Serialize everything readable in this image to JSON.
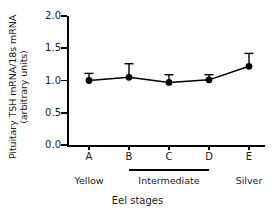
{
  "chart_data": {
    "type": "line",
    "title": "",
    "xlabel": "Eel stages",
    "ylabel": "Pituitary TSH mRNA/18s mRNA (arbitrary units)",
    "ylabel_lines": [
      "Pituitary TSH mRNA/18s mRNA",
      "(arbitrary units)"
    ],
    "categories": [
      "A",
      "B",
      "C",
      "D",
      "E"
    ],
    "values": [
      1.0,
      1.05,
      0.97,
      1.01,
      1.22
    ],
    "errors": [
      0.11,
      0.21,
      0.12,
      0.08,
      0.2
    ],
    "error_type": "SEM",
    "ylim": [
      0.0,
      2.0
    ],
    "yticks": [
      "0.0",
      "0.5",
      "1.0",
      "1.5",
      "2.0"
    ],
    "ytick_values": [
      0.0,
      0.5,
      1.0,
      1.5,
      2.0
    ],
    "grid": false,
    "legend": "none",
    "marker": "filled-circle",
    "line_color": "#000000",
    "marker_color": "#000000",
    "groups": [
      {
        "label": "Yellow",
        "from": "A",
        "to": "A",
        "bracket": false
      },
      {
        "label": "Intermediate",
        "from": "B",
        "to": "D",
        "bracket": true
      },
      {
        "label": "Silver",
        "from": "E",
        "to": "E",
        "bracket": false
      }
    ]
  }
}
